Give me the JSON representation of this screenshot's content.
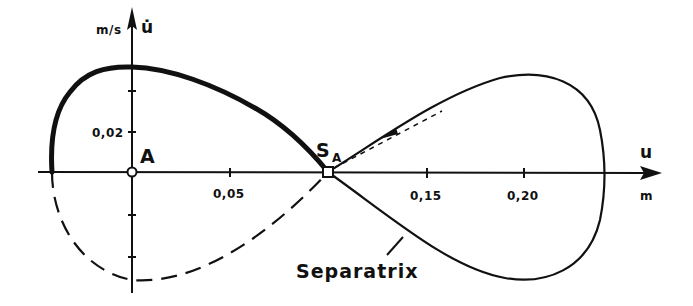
{
  "figure": {
    "type": "phase-portrait",
    "axes": {
      "x": {
        "symbol": "u",
        "unit": "m",
        "ticks": [
          "0,05",
          "0,15",
          "0,20"
        ]
      },
      "y": {
        "symbol": "u̇",
        "unit": "m/s",
        "ticks": [
          "0,02"
        ]
      }
    },
    "points": {
      "A": "A",
      "S": "S",
      "S_sub": "A"
    },
    "annotation": "Separatrix",
    "colors": {
      "ink": "#111111",
      "background": "#ffffff"
    }
  }
}
